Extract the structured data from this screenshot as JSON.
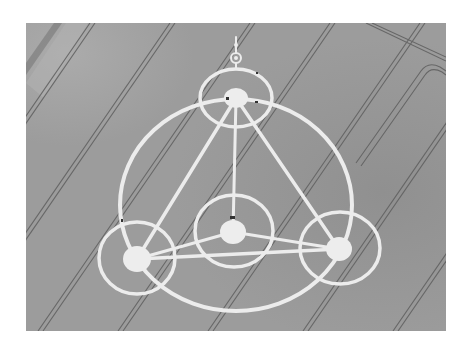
{
  "image": {
    "description": "Aerial grayscale photograph of a crop circle formation in a field with tramlines",
    "colors": {
      "background": "#ffffff",
      "field": "#9c9c9c",
      "field_shade": "#8e8e8e",
      "field_light": "#a9a9a9",
      "flattened_crop": "#ececec",
      "tramline": "#5a5a5a"
    },
    "frame": {
      "x": 26,
      "y": 23,
      "width": 420,
      "height": 308
    },
    "formation": {
      "big_circle": {
        "cx": 210,
        "cy": 180,
        "rx": 116,
        "ry": 106
      },
      "rings": [
        {
          "name": "top",
          "cx": 210,
          "cy": 75,
          "rx": 36,
          "ry": 29
        },
        {
          "name": "center",
          "cx": 208,
          "cy": 208,
          "rx": 39,
          "ry": 36
        },
        {
          "name": "bottom-left",
          "cx": 111,
          "cy": 235,
          "rx": 38,
          "ry": 36
        },
        {
          "name": "bottom-right",
          "cx": 314,
          "cy": 225,
          "rx": 40,
          "ry": 36
        }
      ],
      "nodes": [
        {
          "name": "top",
          "cx": 210,
          "cy": 75,
          "r": 11
        },
        {
          "name": "center",
          "cx": 207,
          "cy": 209,
          "r": 12
        },
        {
          "name": "bottom-left",
          "cx": 111,
          "cy": 236,
          "r": 13
        },
        {
          "name": "bottom-right",
          "cx": 313,
          "cy": 226,
          "r": 12
        }
      ],
      "top_glyph": {
        "ring_cx": 210,
        "ring_cy": 35,
        "ring_r": 5,
        "stem_top": 14
      }
    },
    "tramlines": {
      "slope_dx_per_dy": -0.69,
      "bottom_x": [
        15,
        95,
        185,
        280,
        370,
        455
      ]
    }
  }
}
